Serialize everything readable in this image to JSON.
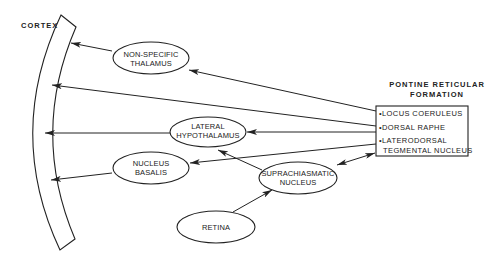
{
  "diagram": {
    "cortex": {
      "label": "CORTEX"
    },
    "nodes": {
      "non_specific_thalamus": {
        "line1": "NON-SPECIFIC",
        "line2": "THALAMUS"
      },
      "lateral_hypothalamus": {
        "line1": "LATERAL",
        "line2": "HYPOTHALAMUS"
      },
      "nucleus_basalis": {
        "line1": "NUCLEUS",
        "line2": "BASALIS"
      },
      "suprachiasmatic_nucleus": {
        "line1": "SUPRACHIASMATIC",
        "line2": "NUCLEUS"
      },
      "retina": {
        "line1": "RETINA"
      }
    },
    "pontine_reticular_formation": {
      "title_line1": "PONTINE RETICULAR",
      "title_line2": "FORMATION",
      "items": [
        {
          "text": "•LOCUS COERULEUS"
        },
        {
          "text": "•DORSAL RAPHE"
        },
        {
          "text": "•LATERODORSAL",
          "text2": "TEGMENTAL NUCLEUS"
        }
      ]
    },
    "connections": [
      {
        "from": "non_specific_thalamus",
        "to": "cortex",
        "type": "arrow"
      },
      {
        "from": "pontine_reticular_formation",
        "to": "non_specific_thalamus",
        "type": "arrow"
      },
      {
        "from": "pontine_reticular_formation",
        "to": "cortex",
        "type": "arrow"
      },
      {
        "from": "pontine_reticular_formation",
        "to": "lateral_hypothalamus",
        "type": "arrow"
      },
      {
        "from": "lateral_hypothalamus",
        "to": "cortex",
        "type": "arrow"
      },
      {
        "from": "pontine_reticular_formation",
        "to": "nucleus_basalis",
        "type": "arrow"
      },
      {
        "from": "nucleus_basalis",
        "to": "cortex",
        "type": "arrow"
      },
      {
        "from": "suprachiasmatic_nucleus",
        "to": "lateral_hypothalamus",
        "type": "arrow"
      },
      {
        "from": "suprachiasmatic_nucleus",
        "to": "pontine_reticular_formation",
        "type": "bidirectional"
      },
      {
        "from": "retina",
        "to": "suprachiasmatic_nucleus",
        "type": "arrow"
      }
    ]
  }
}
